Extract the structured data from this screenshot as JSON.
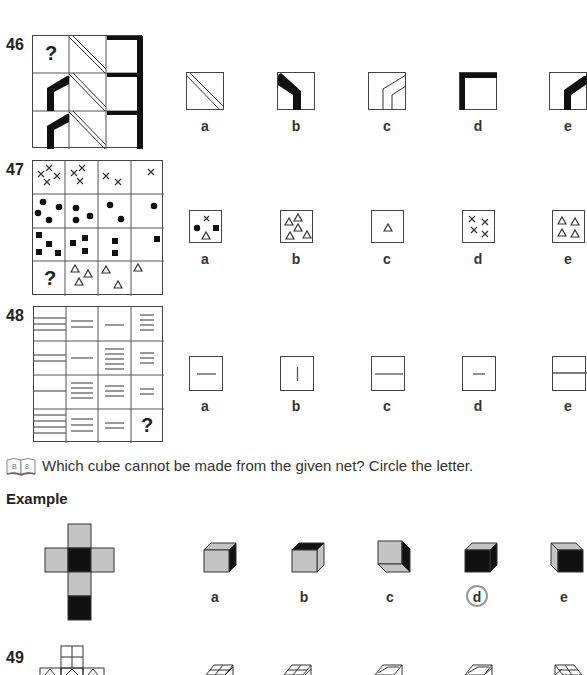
{
  "questions": [
    {
      "number": "46",
      "grid_missing_mark": "?",
      "options": [
        {
          "letter": "a",
          "shape": "double-diagonal-lines"
        },
        {
          "letter": "b",
          "shape": "thick-bent-bar-left"
        },
        {
          "letter": "c",
          "shape": "outlined-bent-bar"
        },
        {
          "letter": "d",
          "shape": "thick-corner-top-left"
        },
        {
          "letter": "e",
          "shape": "thick-bent-bar-right"
        }
      ]
    },
    {
      "number": "47",
      "grid_missing_mark": "?",
      "options": [
        {
          "letter": "a",
          "shape": "mixed-cross-dot-square-triangle"
        },
        {
          "letter": "b",
          "shape": "five-triangles"
        },
        {
          "letter": "c",
          "shape": "one-triangle"
        },
        {
          "letter": "d",
          "shape": "four-crosses"
        },
        {
          "letter": "e",
          "shape": "four-triangles"
        }
      ]
    },
    {
      "number": "48",
      "grid_missing_mark": "?",
      "options": [
        {
          "letter": "a",
          "shape": "short-horizontal-line"
        },
        {
          "letter": "b",
          "shape": "short-vertical-line"
        },
        {
          "letter": "c",
          "shape": "long-horizontal-line"
        },
        {
          "letter": "d",
          "shape": "tiny-horizontal-line"
        },
        {
          "letter": "e",
          "shape": "full-width-divider"
        }
      ]
    }
  ],
  "section": {
    "instruction": "Which cube cannot be made from the given net? Circle the letter.",
    "icon": "book-icon",
    "icon_text": "B 8",
    "example_label": "Example",
    "example_options": [
      {
        "letter": "a",
        "circled": false
      },
      {
        "letter": "b",
        "circled": false
      },
      {
        "letter": "c",
        "circled": false
      },
      {
        "letter": "d",
        "circled": true
      },
      {
        "letter": "e",
        "circled": false
      }
    ]
  },
  "question49": {
    "number": "49"
  },
  "colors": {
    "grey_face": "#c4c4c4",
    "black_face": "#111111",
    "circle": "#999999"
  }
}
